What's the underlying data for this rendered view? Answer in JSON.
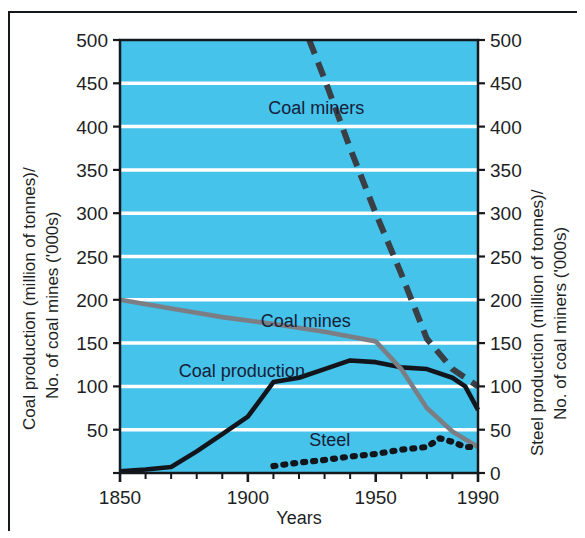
{
  "figure": {
    "background_color": "#ffffff",
    "plot_background_color": "#45c3ea",
    "gridline_color": "#ffffff",
    "frame_color": "#15181c"
  },
  "chart_data": {
    "type": "line",
    "title": "",
    "xlabel": "Years",
    "ylabel": "Coal production (million of tonnes)/ No. of coal mines ('000s)",
    "ylabel_right": "Steel production (million of tonnes)/ No. of coal miners ('000s)",
    "xlim": [
      1850,
      1990
    ],
    "ylim": [
      0,
      500
    ],
    "xticks": [
      1850,
      1860,
      1870,
      1880,
      1890,
      1900,
      1910,
      1920,
      1930,
      1940,
      1950,
      1960,
      1970,
      1980,
      1990
    ],
    "xtick_labels_shown": [
      "1850",
      "1900",
      "1950",
      "1990"
    ],
    "xtick_labels_shown_values": [
      1850,
      1900,
      1950,
      1990
    ],
    "yticks": [
      0,
      50,
      100,
      150,
      200,
      250,
      300,
      350,
      400,
      450,
      500
    ],
    "ytick_labels": [
      "",
      "50",
      "100",
      "150",
      "200",
      "250",
      "300",
      "350",
      "400",
      "450",
      "500"
    ],
    "ytick_labels_right": [
      "0",
      "50",
      "100",
      "150",
      "200",
      "250",
      "300",
      "350",
      "400",
      "450",
      "500"
    ],
    "grid": true,
    "grid_axis": "y",
    "legend_position": "inline-annotations",
    "series": [
      {
        "name": "Coal production",
        "style": "solid",
        "color": "#12161c",
        "label_x": 1873,
        "label_y": 118,
        "x": [
          1850,
          1860,
          1870,
          1880,
          1890,
          1900,
          1910,
          1920,
          1930,
          1940,
          1950,
          1960,
          1970,
          1980,
          1985,
          1990
        ],
        "values": [
          2,
          4,
          7,
          25,
          45,
          65,
          105,
          110,
          120,
          130,
          128,
          122,
          120,
          110,
          100,
          73
        ]
      },
      {
        "name": "Coal mines",
        "style": "solid",
        "color": "#7b7f85",
        "label_x": 1905,
        "label_y": 176,
        "x": [
          1850,
          1870,
          1890,
          1910,
          1930,
          1950,
          1960,
          1970,
          1980,
          1990
        ],
        "values": [
          200,
          190,
          180,
          172,
          163,
          152,
          120,
          75,
          48,
          30
        ]
      },
      {
        "name": "Coal miners",
        "style": "dashed",
        "color": "#3a3f46",
        "label_x": 1908,
        "label_y": 422,
        "x": [
          1924,
          1930,
          1940,
          1950,
          1960,
          1970,
          1980,
          1985,
          1990
        ],
        "values": [
          500,
          455,
          375,
          300,
          230,
          155,
          120,
          110,
          100
        ]
      },
      {
        "name": "Steel",
        "style": "dotted",
        "color": "#12161c",
        "label_x": 1924,
        "label_y": 38,
        "x": [
          1910,
          1920,
          1930,
          1940,
          1950,
          1960,
          1970,
          1975,
          1980,
          1985,
          1990
        ],
        "values": [
          8,
          12,
          15,
          19,
          22,
          27,
          30,
          40,
          36,
          30,
          30
        ]
      }
    ]
  }
}
